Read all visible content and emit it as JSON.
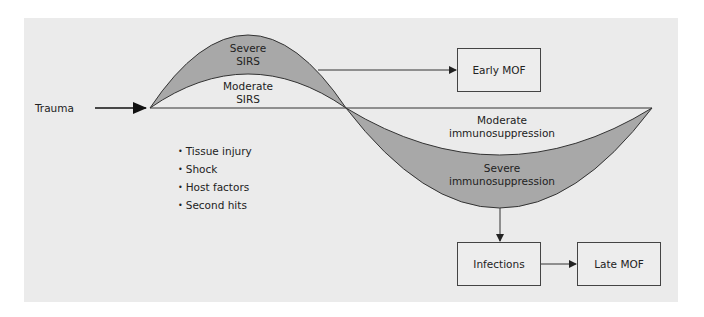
{
  "input": {
    "label": "Trauma"
  },
  "upper_phase": {
    "severe_label": [
      "Severe",
      "SIRS"
    ],
    "moderate_label": [
      "Moderate",
      "SIRS"
    ]
  },
  "lower_phase": {
    "moderate_label": [
      "Moderate",
      "immunosuppression"
    ],
    "severe_label": [
      "Severe",
      "immunosuppression"
    ]
  },
  "factors": [
    "Tissue injury",
    "Shock",
    "Host factors",
    "Second hits"
  ],
  "outcomes": {
    "early": "Early MOF",
    "infections": "Infections",
    "late": "Late MOF"
  },
  "colors": {
    "panel": "#ebebeb",
    "fill": "#a8a8a8",
    "stroke": "#333333"
  }
}
